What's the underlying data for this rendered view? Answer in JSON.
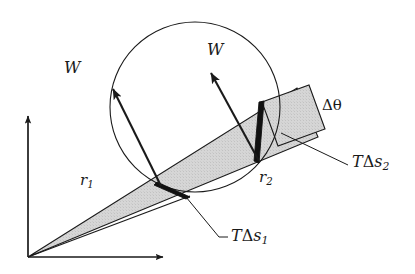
{
  "figure": {
    "type": "physics-vector-diagram",
    "background_color": "#ffffff",
    "line_color": "#1a1a1a",
    "wedge_fill_color": "#d4d4d4",
    "strip_fill_color": "#d4d4d4",
    "canvas": {
      "width": 415,
      "height": 274
    }
  },
  "axes": {
    "origin": {
      "x": 28,
      "y": 257
    },
    "y_axis": {
      "x1": 28,
      "y1": 257,
      "x2": 28,
      "y2": 112,
      "arrow": true
    },
    "x_axis": {
      "x1": 28,
      "y1": 257,
      "x2": 168,
      "y2": 257,
      "arrow": true
    }
  },
  "circle": {
    "cx": 195,
    "cy": 107,
    "r": 85
  },
  "wedge": {
    "apex": {
      "x": 28,
      "y": 257
    },
    "edge1_end": {
      "x": 297,
      "y": 88
    },
    "edge2_end": {
      "x": 318,
      "y": 137
    }
  },
  "strip": {
    "points": "262,102 309,85 325,129 278,146"
  },
  "vectors": [
    {
      "name": "W-left",
      "label": "W",
      "tail": {
        "x": 161,
        "y": 186
      },
      "tip": {
        "x": 110,
        "y": 84
      },
      "label_pos": {
        "x": 66,
        "y": 62
      }
    },
    {
      "name": "W-right",
      "label": "W",
      "tail": {
        "x": 259,
        "y": 161
      },
      "tip": {
        "x": 208,
        "y": 68
      },
      "label_pos": {
        "x": 209,
        "y": 44
      }
    }
  ],
  "tension_forces": [
    {
      "name": "T-delta-s-1",
      "label_T": "T",
      "label_delta": "Δ",
      "label_s": "s",
      "label_sub": "1",
      "wedge_tip": {
        "x": 186,
        "y": 196
      },
      "wedge_base": {
        "x": 157,
        "y": 183
      },
      "leader": {
        "x1": 186,
        "y1": 196,
        "x2": 225,
        "y2": 240
      },
      "label_pos": {
        "x": 230,
        "y": 231
      }
    },
    {
      "name": "T-delta-s-2",
      "label_T": "T",
      "label_delta": "Δ",
      "label_s": "s",
      "label_sub": "2",
      "wedge_tip": {
        "x": 263,
        "y": 104
      },
      "wedge_base": {
        "x": 257,
        "y": 162
      },
      "leader": {
        "x1": 283,
        "y1": 132,
        "x2": 347,
        "y2": 165
      },
      "label_pos": {
        "x": 352,
        "y": 156
      }
    }
  ],
  "labels": {
    "W_left": "W",
    "W_right": "W",
    "r1_base": "r",
    "r1_sub": "1",
    "r2_base": "r",
    "r2_sub": "2",
    "delta_theta": "Δθ",
    "T": "T",
    "delta": "Δ",
    "s": "s",
    "s1_sub": "1",
    "s2_sub": "2",
    "r1_pos": {
      "x": 80,
      "y": 175
    },
    "r2_pos": {
      "x": 258,
      "y": 172
    },
    "delta_theta_pos": {
      "x": 322,
      "y": 100
    }
  }
}
